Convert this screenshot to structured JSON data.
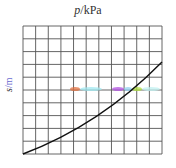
{
  "chart_data": {
    "type": "line",
    "title": "p/kPa",
    "xlabel": "",
    "ylabel": "s/m",
    "grid": true,
    "grid_columns": 11,
    "grid_rows": 10,
    "series": [
      {
        "name": "curve",
        "x": [
          0,
          2,
          4,
          6,
          8,
          10,
          11
        ],
        "y": [
          0,
          1.9,
          3.9,
          5.9,
          8.1,
          10.6,
          11.8
        ],
        "note": "values in grid units; x 0-11, y 0-10 (rows), curve exits top-right near row 7"
      }
    ],
    "annotations": [
      "colored smudge markers along row 5 (orange, purple, green-yellow)"
    ]
  },
  "labels": {
    "title_var": "p",
    "title_unit": "/kPa",
    "ylabel_var": "s",
    "ylabel_unit": "/m"
  }
}
